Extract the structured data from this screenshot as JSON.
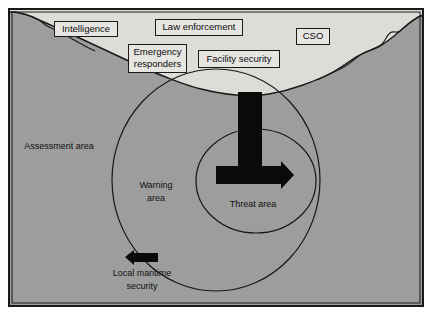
{
  "figure": {
    "frame": {
      "border_color": "#1a1a1a",
      "land_color": "#dedcd7",
      "water_color": "#9d9d9d",
      "ink_color": "#141414"
    }
  },
  "callouts": [
    {
      "id": "intelligence",
      "label": "Intelligence",
      "x": 86,
      "y": 29,
      "w": 63,
      "h": 15
    },
    {
      "id": "law-enforcement",
      "label": "Law enforcement",
      "x": 199,
      "y": 27,
      "w": 87,
      "h": 16
    },
    {
      "id": "cso",
      "label": "CSO",
      "x": 313,
      "y": 36,
      "w": 33,
      "h": 16
    },
    {
      "id": "emergency-responders",
      "label": "Emergency responders",
      "line1": "Emergency",
      "line2": "responders",
      "x": 157,
      "y": 58,
      "w": 58,
      "h": 28
    },
    {
      "id": "facility-security",
      "label": "Facility security",
      "x": 239,
      "y": 59,
      "w": 81,
      "h": 17
    }
  ],
  "zones": [
    {
      "id": "assessment-area",
      "label": "Assessment area",
      "x": 59,
      "y": 147
    },
    {
      "id": "warning-area",
      "label": "Warning area",
      "line1": "Warning",
      "line2": "area",
      "x": 156,
      "y": 192
    },
    {
      "id": "threat-area",
      "label": "Threat area",
      "x": 253,
      "y": 205
    }
  ],
  "vessels": [
    {
      "id": "threat-vessel",
      "label": "",
      "kind": "arrow-right"
    },
    {
      "id": "local-maritime-security-vessel",
      "label": "Local maritime security",
      "line1": "Local maritime",
      "line2": "security",
      "kind": "arrow-left",
      "label_x": 142,
      "label_y": 275
    }
  ],
  "circles": [
    {
      "id": "warning-circle",
      "cx": 216,
      "cy": 180,
      "rx": 104,
      "ry": 111
    },
    {
      "id": "threat-circle",
      "cx": 256,
      "cy": 181,
      "rx": 60,
      "ry": 52
    }
  ]
}
